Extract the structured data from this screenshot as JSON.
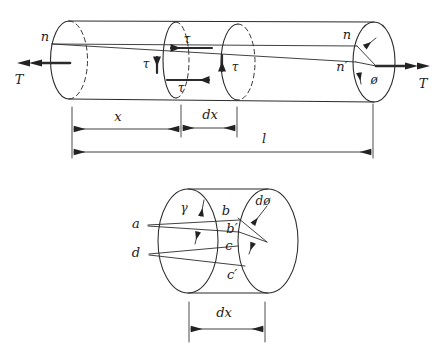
{
  "figure": {
    "colors": {
      "line": "#2b2b2b",
      "background": "#ffffff"
    },
    "top": {
      "n_left": "n",
      "n_right": "n",
      "n_prime": "n′",
      "phi": "ø",
      "tau_top": "τ",
      "tau_left": "τ",
      "tau_bottom": "τ",
      "tau_right": "τ",
      "torque_left": "T",
      "torque_right": "T",
      "dim_x": "x",
      "dim_dx": "dx",
      "dim_l": "l"
    },
    "bottom": {
      "gamma": "γ",
      "a": "a",
      "b": "b",
      "b_prime": "b′",
      "c": "c",
      "c_prime": "c′",
      "d": "d",
      "dphi": "dø",
      "dim_dx": "dx"
    }
  }
}
